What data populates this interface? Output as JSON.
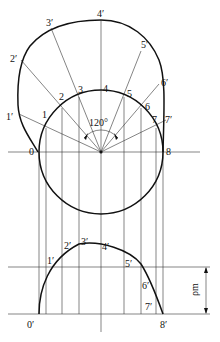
{
  "diagram": {
    "type": "cam-profile-construction",
    "angle_label": "120°",
    "base_circle_points": [
      "0",
      "1",
      "2",
      "3",
      "4",
      "5",
      "6",
      "7",
      "8"
    ],
    "profile_points": [
      "1′",
      "2′",
      "3′",
      "4′",
      "5′",
      "6′",
      "7′"
    ],
    "curve_points": [
      "0′",
      "1′",
      "2′",
      "3′",
      "4′",
      "5′",
      "6′",
      "7′",
      "8′"
    ],
    "dimension_label": "ρm"
  }
}
